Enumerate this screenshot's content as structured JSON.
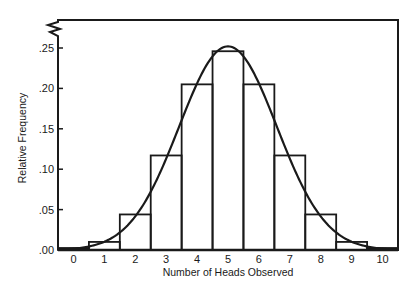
{
  "chart_data": {
    "type": "bar",
    "subtype": "histogram-with-normal-curve",
    "title": "",
    "xlabel": "Number of Heads Observed",
    "ylabel": "Relative Frequency",
    "categories": [
      "0",
      "1",
      "2",
      "3",
      "4",
      "5",
      "6",
      "7",
      "8",
      "9",
      "10"
    ],
    "values": [
      0.001,
      0.01,
      0.044,
      0.117,
      0.205,
      0.246,
      0.205,
      0.117,
      0.044,
      0.01,
      0.001
    ],
    "series": [
      {
        "name": "Relative frequency (histogram)",
        "type": "bar",
        "values": [
          0.001,
          0.01,
          0.044,
          0.117,
          0.205,
          0.246,
          0.205,
          0.117,
          0.044,
          0.01,
          0.001
        ]
      },
      {
        "name": "Normal approximation curve",
        "type": "line",
        "mean": 5,
        "sd": 1.58,
        "peak": 0.252
      }
    ],
    "yticks": [
      ".00",
      ".05",
      ".10",
      ".15",
      ".20",
      ".25"
    ],
    "ytick_values": [
      0.0,
      0.05,
      0.1,
      0.15,
      0.2,
      0.25
    ],
    "ylim": [
      0,
      0.285
    ],
    "xlim": [
      -0.5,
      10.5
    ],
    "grid": false,
    "legend": null,
    "annotations": [
      "axis break symbol at top of y-axis"
    ]
  },
  "colors": {
    "ink": "#1a1a1a",
    "background": "#ffffff"
  }
}
